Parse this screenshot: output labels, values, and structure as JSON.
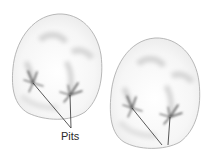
{
  "figure": {
    "labels": {
      "pits": "Pits"
    },
    "colors": {
      "background": "#ffffff",
      "outline": "#a8a8a8",
      "enamel_shade": "#d9d9d9",
      "pit_dark": "#4a4a4a",
      "leader_line": "#2e2e2e",
      "label_text": "#2a2a2a"
    },
    "teeth": [
      {
        "name": "left-tooth",
        "pits": [
          {
            "x": 33,
            "y": 83
          },
          {
            "x": 70,
            "y": 95
          }
        ]
      },
      {
        "name": "right-tooth",
        "pits": [
          {
            "x": 132,
            "y": 108
          },
          {
            "x": 170,
            "y": 117
          }
        ]
      }
    ]
  }
}
